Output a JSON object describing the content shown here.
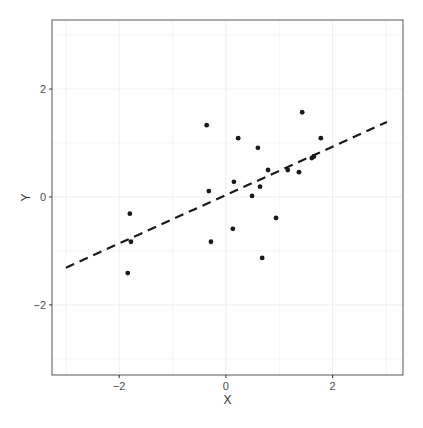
{
  "chart_data": {
    "type": "scatter",
    "title": "",
    "xlabel": "X",
    "ylabel": "Y",
    "xlim": [
      -3.26,
      3.32
    ],
    "ylim": [
      -3.3,
      3.28
    ],
    "x_ticks": [
      -2,
      0,
      2
    ],
    "y_ticks": [
      -2,
      0,
      2
    ],
    "x_tick_labels": [
      "−2",
      "0",
      "2"
    ],
    "y_tick_labels": [
      "−2",
      "0",
      "2"
    ],
    "grid": true,
    "legend": null,
    "series": [
      {
        "name": "points",
        "type": "scatter",
        "color": "#1a1a1a",
        "points": [
          {
            "x": -1.8,
            "y": -0.31
          },
          {
            "x": -1.78,
            "y": -0.83
          },
          {
            "x": -1.84,
            "y": -1.41
          },
          {
            "x": -0.36,
            "y": 1.33
          },
          {
            "x": -0.32,
            "y": 0.11
          },
          {
            "x": -0.28,
            "y": -0.83
          },
          {
            "x": 0.13,
            "y": -0.59
          },
          {
            "x": 0.15,
            "y": 0.28
          },
          {
            "x": 0.23,
            "y": 1.09
          },
          {
            "x": 0.49,
            "y": 0.02
          },
          {
            "x": 0.6,
            "y": 0.91
          },
          {
            "x": 0.64,
            "y": 0.19
          },
          {
            "x": 0.68,
            "y": -1.13
          },
          {
            "x": 0.79,
            "y": 0.5
          },
          {
            "x": 0.94,
            "y": -0.39
          },
          {
            "x": 1.16,
            "y": 0.5
          },
          {
            "x": 1.37,
            "y": 0.46
          },
          {
            "x": 1.43,
            "y": 1.57
          },
          {
            "x": 1.61,
            "y": 0.72
          },
          {
            "x": 1.65,
            "y": 0.75
          },
          {
            "x": 1.78,
            "y": 1.09
          }
        ]
      },
      {
        "name": "fitted line",
        "type": "line",
        "style": "dashed",
        "color": "#1a1a1a",
        "x": [
          -3.0,
          3.02
        ],
        "y": [
          -1.31,
          1.39
        ]
      }
    ]
  },
  "layout": {
    "panel_px": {
      "left": 52,
      "right": 403,
      "top": 20,
      "bottom": 375
    },
    "grid_color": "#ebebeb",
    "border_color": "#555555"
  }
}
